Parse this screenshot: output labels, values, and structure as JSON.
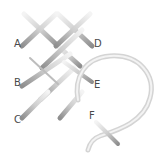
{
  "diagram": {
    "type": "embroidery-stitch-steps",
    "labels": [
      {
        "text": "A",
        "x": 14,
        "y": 43
      },
      {
        "text": "D",
        "x": 94,
        "y": 43
      },
      {
        "text": "B",
        "x": 14,
        "y": 80
      },
      {
        "text": "E",
        "x": 94,
        "y": 82
      },
      {
        "text": "C",
        "x": 14,
        "y": 117
      },
      {
        "text": "F",
        "x": 89,
        "y": 113
      }
    ],
    "colors": {
      "background": "#ffffff",
      "thread_light": "#f2f2f2",
      "thread_dark": "#8c8c8c",
      "label": "#4a4a4a"
    }
  }
}
